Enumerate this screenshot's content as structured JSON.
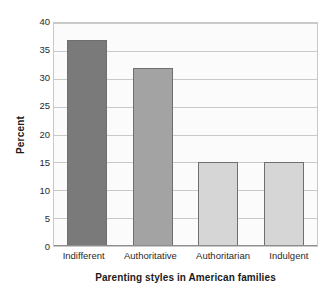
{
  "chart_data": {
    "type": "bar",
    "title": "",
    "categories": [
      "Indifferent",
      "Authoritative",
      "Authoritarian",
      "Indulgent"
    ],
    "values": [
      37,
      32,
      15,
      15
    ],
    "xlabel": "Parenting styles in American families",
    "ylabel": "Percent",
    "ylim": [
      0,
      40
    ],
    "yticks": [
      40,
      35,
      30,
      25,
      20,
      15,
      10,
      5,
      0
    ],
    "ytick_labels": [
      "40",
      "35",
      "30",
      "25",
      "20",
      "15",
      "10",
      "5",
      "0"
    ],
    "grid": "horizontal",
    "legend": "none",
    "bar_colors": [
      "#7a7a7a",
      "#a3a3a3",
      "#d6d6d6",
      "#d6d6d6"
    ],
    "bar_edge_color": "#6f6f6f",
    "plot_background": "#fbfbfb",
    "gridline_color": "#c9c9c9",
    "axis_color": "#8d8d8d"
  }
}
